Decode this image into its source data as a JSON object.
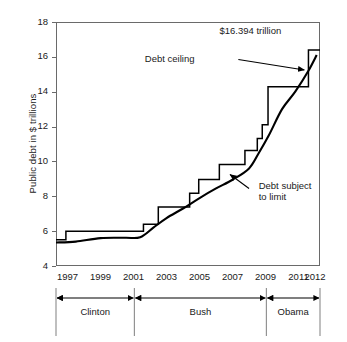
{
  "chart_data": {
    "type": "line",
    "title": "",
    "xlabel": "",
    "ylabel": "Public debt in $ trillions",
    "xlim": [
      1996.3,
      2012.3
    ],
    "ylim": [
      4,
      18
    ],
    "grid": false,
    "legend_position": "inline-annotations",
    "xticks": [
      "1997",
      "1999",
      "2001",
      "2003",
      "2005",
      "2007",
      "2009",
      "2011",
      "2012"
    ],
    "xtick_values": [
      1997,
      1999,
      2001,
      2003,
      2005,
      2007,
      2009,
      2011,
      2012
    ],
    "yticks": [
      "4",
      "6",
      "8",
      "10",
      "12",
      "14",
      "16",
      "18"
    ],
    "ytick_values": [
      4,
      6,
      8,
      10,
      12,
      14,
      16,
      18
    ],
    "annotations": [
      {
        "text": "$16.394 trillion",
        "x": 2009.6,
        "y": 17.5
      },
      {
        "text": "Debt ceiling",
        "x": 2005.2,
        "y": 15.9
      },
      {
        "text": "Debt subject to limit",
        "x": 2008.1,
        "y": 8.6
      }
    ],
    "series": [
      {
        "name": "Debt ceiling",
        "style": "step",
        "color": "#000000",
        "points": [
          {
            "x": 1996.3,
            "y": 5.5
          },
          {
            "x": 1996.9,
            "y": 5.5
          },
          {
            "x": 1996.9,
            "y": 6.0
          },
          {
            "x": 2001.6,
            "y": 6.0
          },
          {
            "x": 2001.6,
            "y": 6.4
          },
          {
            "x": 2002.5,
            "y": 6.4
          },
          {
            "x": 2002.5,
            "y": 7.38
          },
          {
            "x": 2004.4,
            "y": 7.38
          },
          {
            "x": 2004.4,
            "y": 8.18
          },
          {
            "x": 2004.95,
            "y": 8.18
          },
          {
            "x": 2004.95,
            "y": 8.96
          },
          {
            "x": 2006.2,
            "y": 8.96
          },
          {
            "x": 2006.2,
            "y": 9.82
          },
          {
            "x": 2007.75,
            "y": 9.82
          },
          {
            "x": 2007.75,
            "y": 10.62
          },
          {
            "x": 2008.5,
            "y": 10.62
          },
          {
            "x": 2008.5,
            "y": 11.32
          },
          {
            "x": 2008.8,
            "y": 11.32
          },
          {
            "x": 2008.8,
            "y": 12.1
          },
          {
            "x": 2009.15,
            "y": 12.1
          },
          {
            "x": 2009.15,
            "y": 14.29
          },
          {
            "x": 2011.6,
            "y": 14.29
          },
          {
            "x": 2011.6,
            "y": 16.394
          },
          {
            "x": 2012.3,
            "y": 16.394
          }
        ]
      },
      {
        "name": "Debt subject to limit",
        "style": "curve",
        "color": "#000000",
        "points": [
          {
            "x": 1996.3,
            "y": 5.35
          },
          {
            "x": 1997.5,
            "y": 5.4
          },
          {
            "x": 1999.0,
            "y": 5.6
          },
          {
            "x": 2000.5,
            "y": 5.62
          },
          {
            "x": 2001.4,
            "y": 5.65
          },
          {
            "x": 2002.2,
            "y": 6.2
          },
          {
            "x": 2003.0,
            "y": 6.75
          },
          {
            "x": 2004.0,
            "y": 7.3
          },
          {
            "x": 2005.0,
            "y": 7.9
          },
          {
            "x": 2006.0,
            "y": 8.45
          },
          {
            "x": 2007.0,
            "y": 8.95
          },
          {
            "x": 2008.0,
            "y": 9.6
          },
          {
            "x": 2008.6,
            "y": 10.5
          },
          {
            "x": 2009.2,
            "y": 11.5
          },
          {
            "x": 2010.0,
            "y": 13.0
          },
          {
            "x": 2010.8,
            "y": 14.0
          },
          {
            "x": 2011.6,
            "y": 15.2
          },
          {
            "x": 2012.1,
            "y": 16.1
          }
        ]
      }
    ]
  },
  "axis": {
    "y_title": "Public debt in $ trillions"
  },
  "president_band": {
    "label": "presidential-terms",
    "terms": [
      {
        "name": "Clinton",
        "start": 1996.3,
        "end": 2001.05
      },
      {
        "name": "Bush",
        "start": 2001.05,
        "end": 2009.05
      },
      {
        "name": "Obama",
        "start": 2009.05,
        "end": 2012.3
      }
    ]
  },
  "annot_text": {
    "ceiling_value": "$16.394 trillion",
    "ceiling_label": "Debt ceiling",
    "subject_label_line1": "Debt subject",
    "subject_label_line2": "to limit"
  }
}
